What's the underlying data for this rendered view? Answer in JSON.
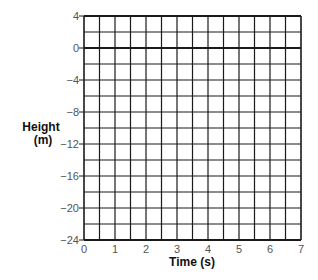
{
  "chart_data": {
    "type": "line",
    "title": "",
    "xlabel": "Time (s)",
    "ylabel": "Height (m)",
    "ylabel_lines": [
      "Height",
      "(m)"
    ],
    "xlim": [
      0,
      7
    ],
    "ylim": [
      -24,
      4
    ],
    "x_ticks": [
      0,
      1,
      2,
      3,
      4,
      5,
      6,
      7
    ],
    "x_tick_labels": [
      "0",
      "1",
      "2",
      "3",
      "4",
      "5",
      "6",
      "7"
    ],
    "y_ticks": [
      4,
      0,
      -4,
      -8,
      -12,
      -16,
      -20,
      -24
    ],
    "y_tick_labels": [
      "4",
      "0",
      "−4",
      "−8",
      "−12",
      "−16",
      "−20",
      "−24"
    ],
    "x_minor_step": 0.5,
    "y_minor_step": 2,
    "grid": true,
    "emphasized_line": {
      "axis": "y",
      "value": 0
    },
    "series": [],
    "legend": null
  },
  "colors": {
    "grid": "#1a1a1a",
    "tick_label": "#555555",
    "axis_title": "#111111",
    "background": "#ffffff"
  }
}
